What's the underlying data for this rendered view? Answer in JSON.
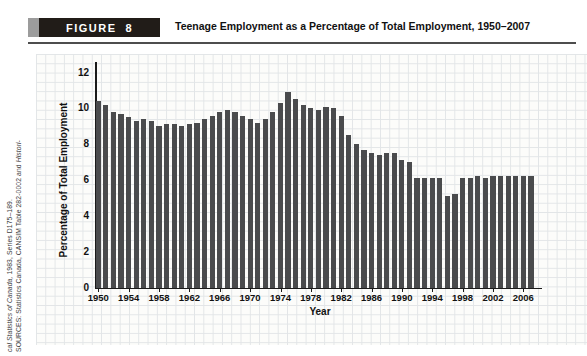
{
  "figure_header": {
    "figure_word": "FIGURE",
    "figure_number": "8",
    "title": "Teenage Employment as a Percentage of Total Employment, 1950–2007"
  },
  "source_note": {
    "line1_regular": "SOURCES: Statistics Canada, CANSIM Table 282-0002 and ",
    "line1_italic": "Histori-",
    "line2_italic": "cal Statistics of Canada,",
    "line2_regular": " 1983, Series D175–189."
  },
  "chart_data": {
    "type": "bar",
    "title": "Teenage Employment as a Percentage of Total Employment, 1950–2007",
    "xlabel": "Year",
    "ylabel": "Percentage of Total Employment",
    "ylim": [
      0,
      12
    ],
    "yticks": [
      0,
      2,
      4,
      6,
      8,
      10,
      12
    ],
    "xtick_labels": [
      1950,
      1954,
      1958,
      1962,
      1966,
      1970,
      1974,
      1978,
      1982,
      1986,
      1990,
      1994,
      1998,
      2002,
      2006
    ],
    "years": [
      1950,
      1951,
      1952,
      1953,
      1954,
      1955,
      1956,
      1957,
      1958,
      1959,
      1960,
      1961,
      1962,
      1963,
      1964,
      1965,
      1966,
      1967,
      1968,
      1969,
      1970,
      1971,
      1972,
      1973,
      1974,
      1975,
      1976,
      1977,
      1978,
      1979,
      1980,
      1981,
      1982,
      1983,
      1984,
      1985,
      1986,
      1987,
      1988,
      1989,
      1990,
      1991,
      1992,
      1993,
      1994,
      1995,
      1996,
      1997,
      1998,
      1999,
      2000,
      2001,
      2002,
      2003,
      2004,
      2005,
      2006,
      2007
    ],
    "values": [
      10.4,
      10.2,
      9.8,
      9.7,
      9.5,
      9.3,
      9.4,
      9.3,
      9.0,
      9.1,
      9.1,
      9.0,
      9.1,
      9.2,
      9.4,
      9.6,
      9.8,
      9.9,
      9.8,
      9.6,
      9.4,
      9.2,
      9.4,
      9.8,
      10.3,
      10.9,
      10.5,
      10.2,
      10.0,
      9.9,
      10.1,
      10.0,
      9.6,
      8.5,
      8.0,
      7.7,
      7.5,
      7.4,
      7.5,
      7.5,
      7.1,
      7.0,
      6.1,
      6.1,
      6.1,
      6.1,
      5.1,
      5.2,
      6.1,
      6.1,
      6.2,
      6.1,
      6.2,
      6.2,
      6.2,
      6.2,
      6.2,
      6.2
    ],
    "bar_color": "#4a4b4d",
    "grid": "graph-paper background, no legend",
    "legend": "none"
  },
  "colors": {
    "figure_box": "#211c18",
    "figure_square": "#9c9c9c",
    "bar": "#4a4b4d",
    "axis": "#1a1a1a",
    "paper_grid_line": "#e2e5e7",
    "paper_background": "#fcfcfa"
  }
}
